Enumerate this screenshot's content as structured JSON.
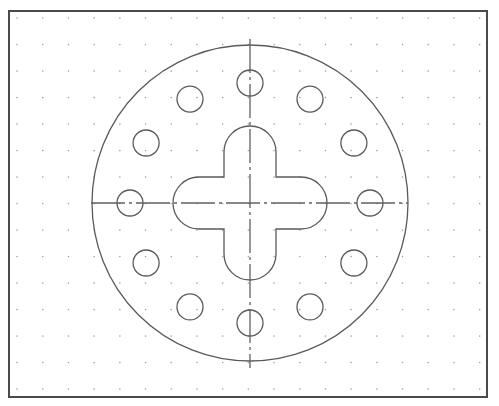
{
  "drawing": {
    "frame": {
      "x": 9,
      "y": 11,
      "width": 478,
      "height": 386,
      "stroke": "#4a4a4a"
    },
    "grid": {
      "x0": 17,
      "y0": 18,
      "dx": 25.7,
      "dy": 26.5,
      "cols": 19,
      "rows": 15,
      "color": "#9a9a9a"
    },
    "center": {
      "x": 250,
      "y": 203
    },
    "outer_circle": {
      "radius": 158
    },
    "center_lines": {
      "horizontal": {
        "x1": 91,
        "x2": 408
      },
      "vertical": {
        "y1": 39,
        "y2": 368
      }
    },
    "bolt_holes": {
      "count": 12,
      "pitch_radius": 120,
      "hole_radius": 13
    },
    "cross_slot": {
      "arm_half_width": 26,
      "arm_extent": 77
    },
    "line_color": "#5a5a5a"
  }
}
